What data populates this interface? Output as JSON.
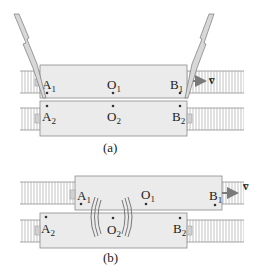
{
  "diagram": {
    "colors": {
      "box_fill": "#ebebeb",
      "box_stroke": "#8a8a8a",
      "track": "#8f8f8f",
      "bolt_fill": "#d8d8d8",
      "bolt_stroke": "#777777",
      "arrow": "#7a7a7a",
      "text": "#222222"
    },
    "panel_a": {
      "caption": "(a)",
      "car1": {
        "A": "A",
        "A_sub": "1",
        "O": "O",
        "O_sub": "1",
        "B": "B",
        "B_sub": "1"
      },
      "car2": {
        "A": "A",
        "A_sub": "2",
        "O": "O",
        "O_sub": "2",
        "B": "B",
        "B_sub": "2"
      },
      "velocity_label": "v̅",
      "events": [
        "lightning-strike-left",
        "lightning-strike-right"
      ]
    },
    "panel_b": {
      "caption": "(b)",
      "car1": {
        "A": "A",
        "A_sub": "1",
        "O": "O",
        "O_sub": "1",
        "B": "B",
        "B_sub": "1"
      },
      "car2": {
        "A": "A",
        "A_sub": "2",
        "O": "O",
        "O_sub": "2",
        "B": "B",
        "B_sub": "2"
      },
      "velocity_label": "v̅",
      "events": [
        "light-waves-meeting-at-O2"
      ]
    }
  }
}
